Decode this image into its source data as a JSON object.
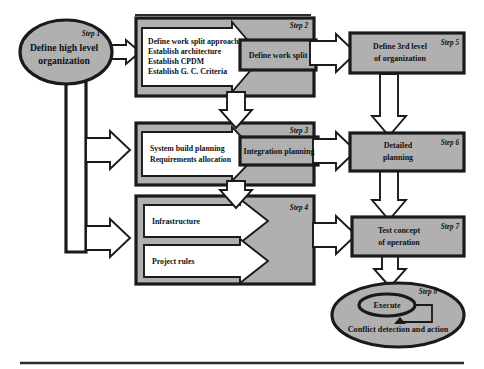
{
  "diagram": {
    "colors": {
      "shape_gray": "#b0b0b0",
      "outline": "#1a1a1a",
      "arrow_white": "#ffffff",
      "rule": "#2b2b2b",
      "background": "#ffffff"
    },
    "nodes": {
      "step1": {
        "step": "Step 1",
        "line1": "Define high level",
        "line2": "organization",
        "shape": "ellipse"
      },
      "step2": {
        "step": "Step 2",
        "arrow_lines": [
          "Define work split approach",
          "Establish architecture",
          "Establish CPDM",
          "Establish G. C. Criteria"
        ],
        "result": "Define work split",
        "shape": "process-block"
      },
      "step3": {
        "step": "Step 3",
        "arrow_lines": [
          "System build planning",
          "Requirements allocation"
        ],
        "result": "Integration planning",
        "shape": "process-block"
      },
      "step4": {
        "step": "Step 4",
        "arrow_lines": [
          "Infrastructure",
          "Project rules"
        ],
        "shape": "process-block-dual"
      },
      "step5": {
        "step": "Step 5",
        "line1": "Define 3rd level",
        "line2": "of organization",
        "shape": "rectangle"
      },
      "step6": {
        "step": "Step 6",
        "line1": "Detailed",
        "line2": "planning",
        "shape": "rectangle"
      },
      "step7": {
        "step": "Step 7",
        "line1": "Test concept",
        "line2": "of operation",
        "shape": "rectangle"
      },
      "step8": {
        "step": "Step 8",
        "inner": "Execute",
        "caption": "Conflict detection and action",
        "shape": "ellipse-nested"
      }
    },
    "connectors": [
      {
        "name": "step1-trunk",
        "from": "step1",
        "to": "vertical-bus",
        "style": "thick-pipe"
      },
      {
        "name": "step1-to-step2",
        "from": "step1",
        "to": "step2",
        "style": "block-arrow-right"
      },
      {
        "name": "bus-to-step3",
        "from": "vertical-bus",
        "to": "step3",
        "style": "block-arrow-right"
      },
      {
        "name": "bus-to-step4",
        "from": "vertical-bus",
        "to": "step4",
        "style": "block-arrow-right"
      },
      {
        "name": "step2-to-step5",
        "from": "step2",
        "to": "step5",
        "style": "block-arrow-right"
      },
      {
        "name": "step3-to-step6",
        "from": "step3",
        "to": "step6",
        "style": "block-arrow-right"
      },
      {
        "name": "step4-to-step7",
        "from": "step4",
        "to": "step7",
        "style": "block-arrow-right"
      },
      {
        "name": "step2-to-step3",
        "from": "step2",
        "to": "step3",
        "style": "block-arrow-down"
      },
      {
        "name": "step3-to-step4",
        "from": "step3",
        "to": "step4",
        "style": "block-arrow-down"
      },
      {
        "name": "step5-to-step6",
        "from": "step5",
        "to": "step6",
        "style": "block-arrow-down"
      },
      {
        "name": "step6-to-step7",
        "from": "step6",
        "to": "step7",
        "style": "block-arrow-down"
      },
      {
        "name": "step7-to-step8",
        "from": "step7",
        "to": "step8",
        "style": "block-arrow-down"
      },
      {
        "name": "step8-feedback-loop",
        "from": "step8",
        "to": "step8",
        "style": "loop-back"
      }
    ],
    "rules": [
      {
        "name": "top-rule",
        "x1": 135,
        "y1": 15,
        "x2": 311,
        "y2": 15
      },
      {
        "name": "bottom-rule",
        "x1": 20,
        "y1": 363,
        "x2": 464,
        "y2": 363
      }
    ]
  }
}
